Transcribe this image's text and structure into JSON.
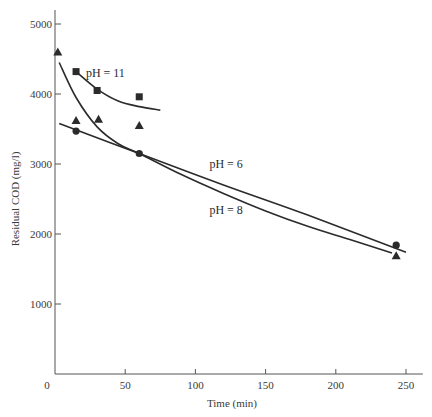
{
  "chart_data": {
    "type": "scatter",
    "title": "",
    "xlabel": "Time (min)",
    "ylabel": "Residual COD (mg/l)",
    "xlim": [
      0,
      262
    ],
    "ylim": [
      0,
      5200
    ],
    "x_ticks": [
      0,
      50,
      100,
      150,
      200,
      250
    ],
    "y_ticks": [
      1000,
      2000,
      3000,
      4000,
      5000
    ],
    "grid": false,
    "legend": "inline curve labels",
    "series": [
      {
        "name": "pH = 11",
        "marker": "square",
        "points": [
          [
            15,
            4320
          ],
          [
            30,
            4050
          ],
          [
            60,
            3960
          ]
        ],
        "fit_curve": [
          [
            15,
            4320
          ],
          [
            30,
            4070
          ],
          [
            45,
            3900
          ],
          [
            60,
            3820
          ],
          [
            75,
            3770
          ]
        ],
        "label_pos": [
          22,
          4300
        ]
      },
      {
        "name": "pH = 8",
        "marker": "triangle",
        "points": [
          [
            2,
            4600
          ],
          [
            15,
            3620
          ],
          [
            31,
            3640
          ],
          [
            60,
            3550
          ],
          [
            243,
            1690
          ]
        ],
        "fit_curve": [
          [
            3,
            4450
          ],
          [
            15,
            3950
          ],
          [
            30,
            3530
          ],
          [
            45,
            3290
          ],
          [
            60,
            3150
          ],
          [
            90,
            2850
          ],
          [
            120,
            2580
          ],
          [
            150,
            2330
          ],
          [
            180,
            2110
          ],
          [
            210,
            1920
          ],
          [
            240,
            1730
          ]
        ],
        "label_pos": [
          110,
          2350
        ]
      },
      {
        "name": "pH = 6",
        "marker": "circle",
        "points": [
          [
            15,
            3470
          ],
          [
            60,
            3150
          ],
          [
            243,
            1840
          ]
        ],
        "fit_curve": [
          [
            3,
            3580
          ],
          [
            60,
            3150
          ],
          [
            120,
            2700
          ],
          [
            180,
            2270
          ],
          [
            250,
            1740
          ]
        ],
        "label_pos": [
          110,
          3000
        ]
      }
    ]
  }
}
